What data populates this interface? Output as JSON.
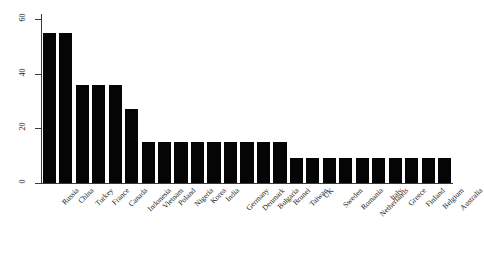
{
  "chart_data": {
    "type": "bar",
    "title": "",
    "xlabel": "",
    "ylabel": "Services imports percentage change",
    "ylim": [
      0,
      62
    ],
    "yticks": [
      0,
      20,
      40,
      60
    ],
    "ytick_labels": [
      "0",
      "20",
      "40",
      "60"
    ],
    "grid": false,
    "legend": null,
    "bar_color": "#050505",
    "categories": [
      "Russia",
      "China",
      "Turkey",
      "France",
      "Canada",
      "Indonesia",
      "Vietnam",
      "Poland",
      "Nigeria",
      "Korea",
      "India",
      "Germany",
      "Denmark",
      "Bulgaria",
      "Brunei",
      "Taiwan",
      "UK",
      "Sweden",
      "Romania",
      "Netherlands",
      "Italy",
      "Greece",
      "Finland",
      "Belgium",
      "Australia"
    ],
    "values": [
      55,
      55,
      36,
      36,
      36,
      27,
      15,
      15,
      15,
      15,
      15,
      15,
      15,
      15,
      15,
      9,
      9,
      9,
      9,
      9,
      9,
      9,
      9,
      9,
      9
    ]
  }
}
